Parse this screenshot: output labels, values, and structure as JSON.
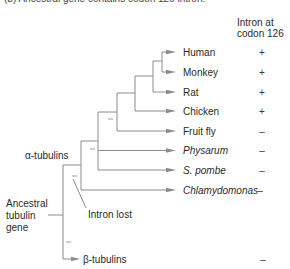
{
  "caption_clipped": "(b)  Ancestral gene contains codon 126 intron.",
  "header": {
    "line1": "Intron at",
    "line2": "codon 126"
  },
  "taxa": [
    {
      "label": "Human",
      "italic": false,
      "intron": "+"
    },
    {
      "label": "Monkey",
      "italic": false,
      "intron": "+"
    },
    {
      "label": "Rat",
      "italic": false,
      "intron": "+"
    },
    {
      "label": "Chicken",
      "italic": false,
      "intron": "+"
    },
    {
      "label": "Fruit fly",
      "italic": false,
      "intron": "–"
    },
    {
      "label": "Physarum",
      "italic": true,
      "intron": "–"
    },
    {
      "label": "S. pombe",
      "italic": true,
      "intron": "–"
    },
    {
      "label": "Chlamydomonas",
      "italic": true,
      "intron": "–"
    },
    {
      "label": "β-tubulins",
      "italic": false,
      "intron": "–"
    }
  ],
  "annotations": {
    "alpha_group": "α-tubulins",
    "root_line1": "Ancestral",
    "root_line2": "tubulin",
    "root_line3": "gene",
    "intron_lost": "Intron lost"
  },
  "colors": {
    "branch": "#8c8c8c",
    "text": "#2a2a2a",
    "background": "#ffffff"
  }
}
